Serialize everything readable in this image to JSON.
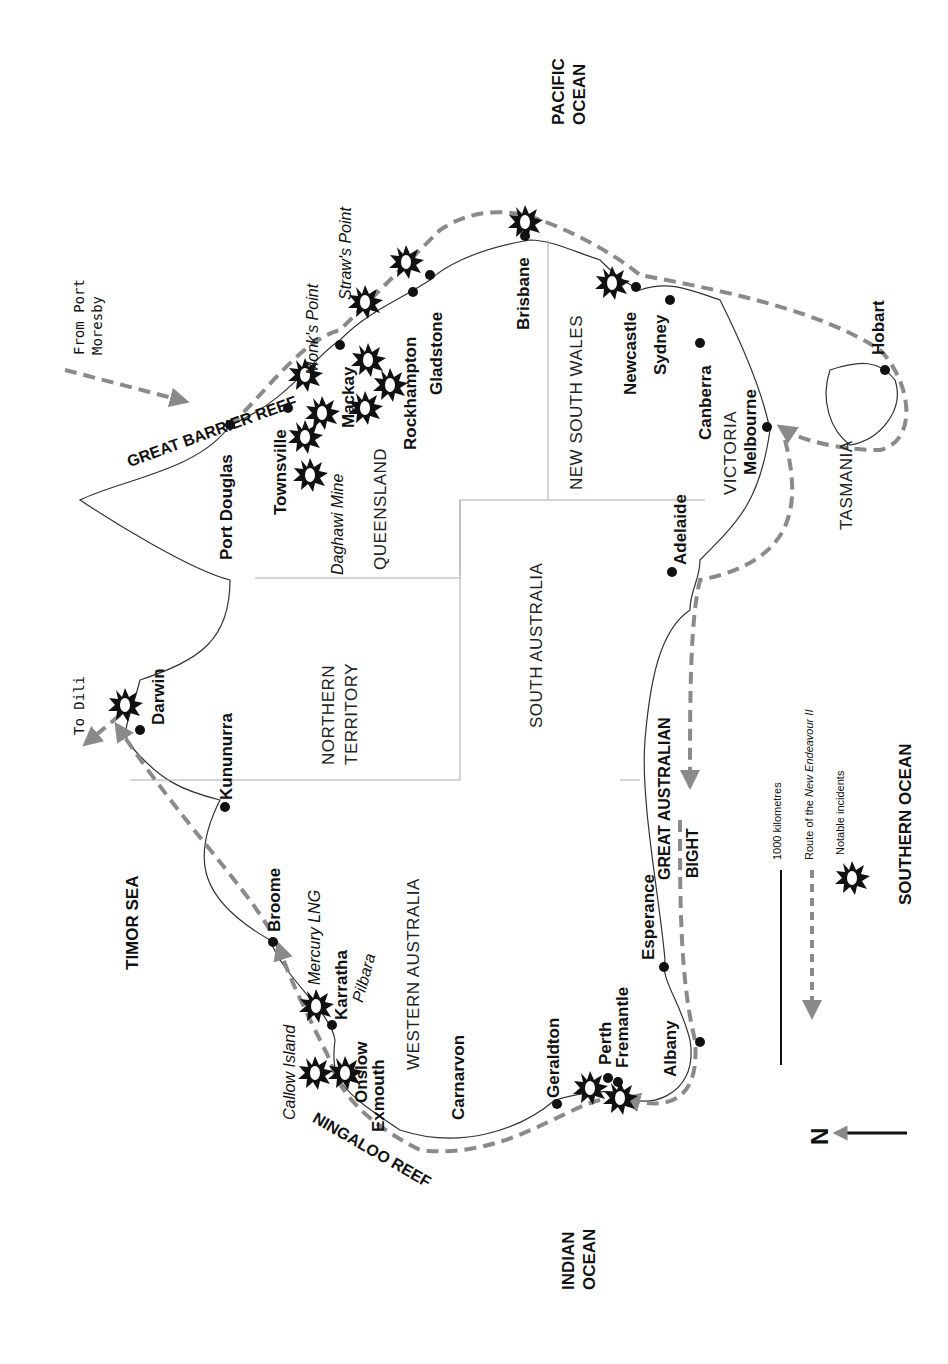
{
  "map": {
    "orientation": "north-left",
    "colors": {
      "route": "#8a8a8a",
      "coast": "#333333",
      "border": "#aaaaaa",
      "city": "#111111",
      "incident": "#111111"
    },
    "oceans": [
      {
        "id": "pacific",
        "line1": "PACIFIC",
        "line2": "OCEAN"
      },
      {
        "id": "indian",
        "line1": "INDIAN",
        "line2": "OCEAN"
      },
      {
        "id": "southern",
        "line1": "SOUTHERN OCEAN"
      },
      {
        "id": "timor",
        "line1": "TIMOR SEA"
      }
    ],
    "features": {
      "great_barrier_reef": "GREAT BARRIER REEF",
      "ningaloo_reef": "NINGALOO REEF",
      "great_australian_bight_1": "GREAT AUSTRALIAN",
      "great_australian_bight_2": "BIGHT",
      "from_port_moresby_1": "From Port",
      "from_port_moresby_2": "Moresby",
      "to_dili": "To Dili",
      "pilbara": "Pilbara",
      "callow_island": "Callow Island",
      "mercury_lng": "Mercury LNG",
      "daghawi_mine": "Daghawi Mine",
      "monks_point": "Monk's Point",
      "straws_point": "Straw's Point"
    },
    "states": {
      "queensland": "QUEENSLAND",
      "new_south_wales": "NEW SOUTH WALES",
      "victoria": "VICTORIA",
      "tasmania": "TASMANIA",
      "south_australia": "SOUTH AUSTRALIA",
      "northern_territory_1": "NORTHERN",
      "northern_territory_2": "TERRITORY",
      "western_australia": "WESTERN AUSTRALIA"
    },
    "cities": {
      "port_douglas": "Port Douglas",
      "townsville": "Townsville",
      "mackay": "Mackay",
      "rockhampton": "Rockhampton",
      "gladstone": "Gladstone",
      "brisbane": "Brisbane",
      "newcastle": "Newcastle",
      "sydney": "Sydney",
      "canberra": "Canberra",
      "melbourne": "Melbourne",
      "hobart": "Hobart",
      "adelaide": "Adelaide",
      "esperance": "Esperance",
      "albany": "Albany",
      "perth": "Perth",
      "fremantle": "Fremantle",
      "geraldton": "Geraldton",
      "carnarvon": "Carnarvon",
      "exmouth": "Exmouth",
      "onslow": "Onslow",
      "karratha": "Karratha",
      "broome": "Broome",
      "kununurra": "Kununurra",
      "darwin": "Darwin"
    },
    "legend": {
      "scale": "1000 kilometres",
      "route_prefix": "Route of the ",
      "route_ship": "New Endeavour II",
      "incidents": "Notable incidents",
      "north": "N"
    }
  }
}
